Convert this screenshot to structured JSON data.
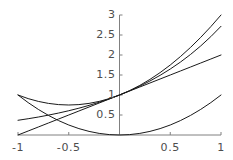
{
  "chart_data": {
    "type": "line",
    "title": "",
    "subtitle": "",
    "xlabel": "",
    "ylabel": "",
    "xlim": [
      -1,
      1
    ],
    "ylim": [
      0,
      3
    ],
    "grid": false,
    "legend": "none",
    "axis_style": "cross-axes-through-origin",
    "axis_color": "#808080",
    "curve_color": "#1a1a1a",
    "x_ticks": [
      {
        "value": -1,
        "label": "-1"
      },
      {
        "value": -0.5,
        "label": "-0.5"
      },
      {
        "value": 0.5,
        "label": "0.5"
      },
      {
        "value": 1,
        "label": "1"
      }
    ],
    "y_ticks": [
      {
        "value": 0.5,
        "label": "0.5"
      },
      {
        "value": 1,
        "label": "1"
      },
      {
        "value": 1.5,
        "label": "1.5"
      },
      {
        "value": 2,
        "label": "2"
      },
      {
        "value": 2.5,
        "label": "2.5"
      },
      {
        "value": 3,
        "label": "3"
      }
    ],
    "x": [
      -1,
      -0.9,
      -0.8,
      -0.7,
      -0.6,
      -0.5,
      -0.4,
      -0.3,
      -0.2,
      -0.1,
      0,
      0.1,
      0.2,
      0.3,
      0.4,
      0.5,
      0.6,
      0.7,
      0.8,
      0.9,
      1
    ],
    "series": [
      {
        "name": "exponential-curve",
        "expression": "e^x",
        "values": [
          0.368,
          0.407,
          0.449,
          0.497,
          0.549,
          0.607,
          0.67,
          0.741,
          0.819,
          0.905,
          1.0,
          1.105,
          1.221,
          1.35,
          1.492,
          1.649,
          1.822,
          2.014,
          2.226,
          2.46,
          2.718
        ]
      },
      {
        "name": "linear-curve",
        "expression": "1 + x",
        "values": [
          0.0,
          0.1,
          0.2,
          0.3,
          0.4,
          0.5,
          0.6,
          0.7,
          0.8,
          0.9,
          1.0,
          1.1,
          1.2,
          1.3,
          1.4,
          1.5,
          1.6,
          1.7,
          1.8,
          1.9,
          2.0
        ]
      },
      {
        "name": "quadratic-curve",
        "expression": "x^2",
        "values": [
          1.0,
          0.81,
          0.64,
          0.49,
          0.36,
          0.25,
          0.16,
          0.09,
          0.04,
          0.01,
          0.0,
          0.01,
          0.04,
          0.09,
          0.16,
          0.25,
          0.36,
          0.49,
          0.64,
          0.81,
          1.0
        ]
      },
      {
        "name": "upper-bound-curve",
        "expression": "1 + x + x^2",
        "values": [
          1.0,
          0.91,
          0.84,
          0.79,
          0.76,
          0.75,
          0.76,
          0.79,
          0.84,
          0.91,
          1.0,
          1.11,
          1.24,
          1.39,
          1.56,
          1.75,
          1.96,
          2.19,
          2.44,
          2.71,
          3.0
        ]
      }
    ]
  }
}
